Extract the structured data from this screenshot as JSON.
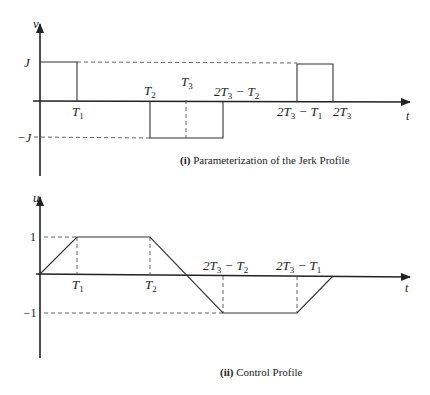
{
  "figure_i": {
    "y_label": "v",
    "x_label": "t",
    "level_pos": "J",
    "level_neg": "−J",
    "ticks": {
      "T1": "T",
      "T1_sub": "1",
      "T2": "T",
      "T2_sub": "2",
      "T3": "T",
      "T3_sub": "3",
      "two_T3_minus_T2": "2T",
      "two_T3_minus_T2_sub": "3",
      "two_T3_minus_T2_rest": " − T",
      "two_T3_minus_T2_sub2": "2",
      "two_T3_minus_T1": "2T",
      "two_T3_minus_T1_sub": "3",
      "two_T3_minus_T1_rest": " − T",
      "two_T3_minus_T1_sub2": "1",
      "two_T3": "2T",
      "two_T3_sub": "3"
    },
    "caption_num": "(i)",
    "caption_text": " Parameterization of the Jerk Profile"
  },
  "figure_ii": {
    "y_label": "u",
    "x_label": "t",
    "level_pos": "1",
    "level_neg": "−1",
    "ticks": {
      "T1": "T",
      "T1_sub": "1",
      "T2": "T",
      "T2_sub": "2",
      "two_T3_minus_T2": "2T",
      "two_T3_minus_T2_sub": "3",
      "two_T3_minus_T2_rest": " − T",
      "two_T3_minus_T2_sub2": "2",
      "two_T3_minus_T1": "2T",
      "two_T3_minus_T1_sub": "3",
      "two_T3_minus_T1_rest": " − T",
      "two_T3_minus_T1_sub2": "1"
    },
    "caption_num": "(ii)",
    "caption_text": " Control Profile"
  }
}
